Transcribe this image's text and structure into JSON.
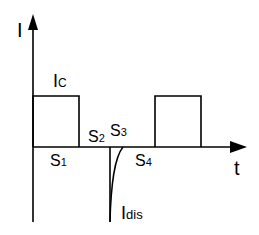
{
  "diagram": {
    "type": "current-waveform",
    "axes": {
      "y_label": "I",
      "x_label": "t"
    },
    "labels": {
      "charge_current": {
        "main": "I",
        "sub": "C"
      },
      "discharge_current": {
        "main": "I",
        "sub": "dis"
      },
      "s1": {
        "main": "S",
        "sub": "1"
      },
      "s2": {
        "main": "S",
        "sub": "2"
      },
      "s3": {
        "main": "S",
        "sub": "3"
      },
      "s4": {
        "main": "S",
        "sub": "4"
      }
    },
    "colors": {
      "stroke": "#000000",
      "background": "#ffffff"
    }
  }
}
